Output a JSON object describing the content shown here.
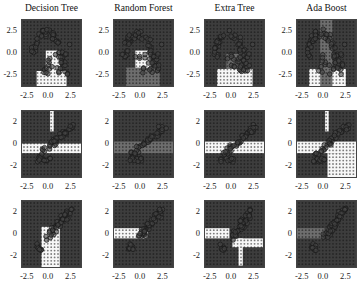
{
  "figure": {
    "width": 364,
    "height": 291
  },
  "columns": [
    {
      "label": "Decision Tree"
    },
    {
      "label": "Random Forest"
    },
    {
      "label": "Extra Tree"
    },
    {
      "label": "Ada Boost"
    }
  ],
  "colors": {
    "dark": "#3d3d3d",
    "mid": "#6e6e6e",
    "light": "#d8d8d8",
    "white": "#f7f7f7",
    "frame": "#444444"
  },
  "chart_data": [
    {
      "type": "scatter",
      "row": 0,
      "col": 0,
      "title": "Decision Tree",
      "xticks": [
        "-2.5",
        "0.0",
        "2.5"
      ],
      "yticks": [
        "2.5",
        "0.0",
        "-2.5"
      ],
      "xlim": [
        -3.5,
        3.5
      ],
      "ylim": [
        -3.8,
        4.2
      ],
      "description": "Decision boundary regions with two-class scatter (moons-like dataset)"
    },
    {
      "type": "scatter",
      "row": 0,
      "col": 1,
      "title": "Random Forest",
      "xticks": [
        "-2.5",
        "0.0",
        "2.5"
      ],
      "yticks": [
        "2.5",
        "0.0",
        "-2.5"
      ],
      "xlim": [
        -3.5,
        3.5
      ],
      "ylim": [
        -3.8,
        4.2
      ]
    },
    {
      "type": "scatter",
      "row": 0,
      "col": 2,
      "title": "Extra Tree",
      "xticks": [
        "-2.5",
        "0.0",
        "2.5"
      ],
      "yticks": [
        "2.5",
        "0.0",
        "-2.5"
      ],
      "xlim": [
        -3.5,
        3.5
      ],
      "ylim": [
        -3.8,
        4.2
      ]
    },
    {
      "type": "scatter",
      "row": 0,
      "col": 3,
      "title": "Ada Boost",
      "xticks": [
        "-2.5",
        "0.0",
        "2.5"
      ],
      "yticks": [
        "2.5",
        "0.0",
        "-2.5"
      ],
      "xlim": [
        -3.5,
        3.5
      ],
      "ylim": [
        -3.8,
        4.2
      ]
    },
    {
      "type": "scatter",
      "row": 1,
      "col": 0,
      "xticks": [
        "-2.5",
        "0.0",
        "2.5"
      ],
      "yticks": [
        "2",
        "0",
        "-2"
      ],
      "xlim": [
        -3,
        3.3
      ],
      "ylim": [
        -3,
        2.8
      ]
    },
    {
      "type": "scatter",
      "row": 1,
      "col": 1,
      "xticks": [
        "-2.5",
        "0.0",
        "2.5"
      ],
      "yticks": [
        "2",
        "0",
        "-2"
      ],
      "xlim": [
        -3,
        3.3
      ],
      "ylim": [
        -3,
        2.8
      ]
    },
    {
      "type": "scatter",
      "row": 1,
      "col": 2,
      "xticks": [
        "-2.5",
        "0.0",
        "2.5"
      ],
      "yticks": [
        "2",
        "0",
        "-2"
      ],
      "xlim": [
        -3,
        3.3
      ],
      "ylim": [
        -3,
        2.8
      ]
    },
    {
      "type": "scatter",
      "row": 1,
      "col": 3,
      "xticks": [
        "-2.5",
        "0.0",
        "2.5"
      ],
      "yticks": [
        "2",
        "0",
        "-2"
      ],
      "xlim": [
        -3,
        3.3
      ],
      "ylim": [
        -3,
        2.8
      ]
    },
    {
      "type": "scatter",
      "row": 2,
      "col": 0,
      "xticks": [
        "-2.5",
        "0.0",
        "2.5"
      ],
      "yticks": [
        "2",
        "0",
        "-2"
      ],
      "xlim": [
        -3,
        3
      ],
      "ylim": [
        -2.6,
        2.6
      ]
    },
    {
      "type": "scatter",
      "row": 2,
      "col": 1,
      "xticks": [
        "-2.5",
        "0.0",
        "2.5"
      ],
      "yticks": [
        "2",
        "0",
        "-2"
      ],
      "xlim": [
        -3,
        3
      ],
      "ylim": [
        -2.6,
        2.6
      ]
    },
    {
      "type": "scatter",
      "row": 2,
      "col": 2,
      "xticks": [
        "-2.5",
        "0.0",
        "2.5"
      ],
      "yticks": [
        "2",
        "0",
        "-2"
      ],
      "xlim": [
        -3,
        3
      ],
      "ylim": [
        -2.6,
        2.6
      ]
    },
    {
      "type": "scatter",
      "row": 2,
      "col": 3,
      "xticks": [
        "-2.5",
        "0.0",
        "2.5"
      ],
      "yticks": [
        "2",
        "0",
        "-2"
      ],
      "xlim": [
        -3,
        3
      ],
      "ylim": [
        -2.6,
        2.6
      ]
    }
  ],
  "layout": {
    "col_left": [
      21,
      113,
      204,
      296
    ],
    "row_top": [
      19,
      110,
      200
    ],
    "panel_w": 61,
    "panel_h": 68
  },
  "regions": [
    [
      [
        0.24,
        0.75,
        0.73,
        1.0,
        "w"
      ],
      [
        0.39,
        0.45,
        0.62,
        1.0,
        "w"
      ]
    ],
    [
      [
        0.2,
        0.7,
        0.75,
        1.0,
        "m"
      ],
      [
        0.35,
        0.45,
        0.6,
        1.0,
        "w"
      ],
      [
        0.0,
        0.0,
        1.0,
        1.0,
        "dm"
      ]
    ],
    [
      [
        0.2,
        0.72,
        0.78,
        1.0,
        "w"
      ],
      [
        0.35,
        0.5,
        0.6,
        0.72,
        "m"
      ],
      [
        0.0,
        0.0,
        1.0,
        1.0,
        "dm"
      ]
    ],
    [
      [
        0.38,
        0.0,
        0.58,
        1.0,
        "m"
      ],
      [
        0.2,
        0.72,
        0.8,
        1.0,
        "w"
      ],
      [
        0.0,
        0.0,
        1.0,
        1.0,
        "dm"
      ]
    ],
    [
      [
        0.0,
        0.48,
        1.0,
        0.62,
        "w"
      ],
      [
        0.46,
        0.0,
        0.52,
        0.3,
        "w"
      ]
    ],
    [
      [
        0.0,
        0.45,
        1.0,
        0.62,
        "m"
      ],
      [
        0.0,
        0.62,
        0.55,
        1.0,
        "d"
      ],
      [
        0.0,
        0.0,
        1.0,
        1.0,
        "dm"
      ]
    ],
    [
      [
        0.0,
        0.45,
        1.0,
        0.62,
        "w"
      ],
      [
        0.0,
        0.0,
        1.0,
        1.0,
        "dm"
      ],
      [
        0.55,
        0.62,
        1.0,
        1.0,
        "m"
      ]
    ],
    [
      [
        0.0,
        0.45,
        1.0,
        0.62,
        "w"
      ],
      [
        0.5,
        0.62,
        1.0,
        1.0,
        "w"
      ],
      [
        0.46,
        0.0,
        0.52,
        0.3,
        "w"
      ],
      [
        0.0,
        0.0,
        1.0,
        1.0,
        "dm"
      ]
    ],
    [
      [
        0.32,
        0.38,
        0.62,
        1.0,
        "w"
      ]
    ],
    [
      [
        0.0,
        0.4,
        0.55,
        0.55,
        "w"
      ],
      [
        0.0,
        0.0,
        1.0,
        1.0,
        "dm"
      ]
    ],
    [
      [
        0.0,
        0.4,
        0.4,
        0.55,
        "w"
      ],
      [
        0.45,
        0.55,
        0.95,
        0.68,
        "w"
      ],
      [
        0.55,
        0.55,
        0.62,
        0.95,
        "w"
      ],
      [
        0.0,
        0.0,
        1.0,
        1.0,
        "dm"
      ]
    ],
    [
      [
        0.0,
        0.4,
        0.45,
        0.55,
        "m"
      ],
      [
        0.0,
        0.0,
        1.0,
        1.0,
        "dm"
      ]
    ]
  ]
}
